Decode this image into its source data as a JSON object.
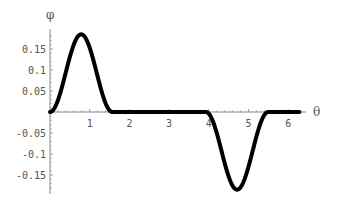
{
  "chart_data": {
    "type": "line",
    "title": "",
    "xlabel": "θ",
    "ylabel": "φ",
    "xlim": [
      0,
      6.2832
    ],
    "ylim": [
      -0.19,
      0.19
    ],
    "grid": false,
    "legend": null,
    "x_ticks": [
      1,
      2,
      3,
      4,
      5,
      6
    ],
    "x_tick_labels": [
      "1",
      "2",
      "3",
      "4",
      "5",
      "6"
    ],
    "y_ticks": [
      0.15,
      0.1,
      0.05,
      -0.05,
      -0.1,
      -0.15
    ],
    "y_tick_labels": [
      "0.15",
      "0.1",
      "0.05",
      "-0.05",
      "-0.1",
      "-0.15"
    ],
    "series": [
      {
        "name": "φ(θ)",
        "color": "#000000",
        "description": "Positive bump on [0, π/2] peaking ≈0.185 at θ≈π/4; zero on [π/2, 5π/4]; negative bump on [5π/4, 7π/4] with minimum ≈-0.185 at θ≈3π/2; zero on [7π/4, 2π]",
        "x": [
          0,
          0.2,
          0.4,
          0.6,
          0.785,
          1.0,
          1.2,
          1.4,
          1.571,
          2.0,
          3.0,
          3.927,
          4.1,
          4.3,
          4.5,
          4.712,
          4.9,
          5.1,
          5.3,
          5.498,
          6.0,
          6.283
        ],
        "y": [
          0,
          0.028,
          0.096,
          0.159,
          0.185,
          0.153,
          0.082,
          0.02,
          0,
          0,
          0,
          0,
          -0.023,
          -0.088,
          -0.155,
          -0.185,
          -0.16,
          -0.102,
          -0.036,
          0,
          0,
          0
        ]
      }
    ]
  }
}
